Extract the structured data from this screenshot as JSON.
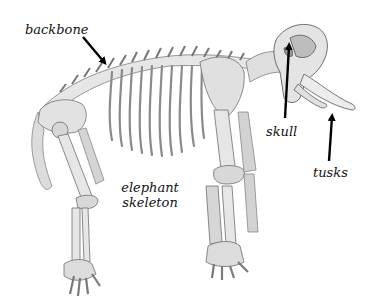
{
  "diagram": {
    "title": "elephant skeleton",
    "title_lines": [
      "elephant",
      "skeleton"
    ],
    "colors": {
      "background": "#ffffff",
      "bone_fill": "#e4e4e4",
      "bone_shade": "#b9b9b9",
      "bone_outline": "#6f6f6f",
      "arrow": "#000000",
      "text": "#111111"
    },
    "labels": [
      {
        "id": "backbone",
        "text": "backbone",
        "x": 25,
        "y": 22,
        "arrow_from": [
          83,
          37
        ],
        "arrow_to": [
          108,
          66
        ]
      },
      {
        "id": "skull",
        "text": "skull",
        "x": 266,
        "y": 125,
        "arrow_from": [
          285,
          118
        ],
        "arrow_to": [
          289,
          42
        ]
      },
      {
        "id": "tusks",
        "text": "tusks",
        "x": 313,
        "y": 166,
        "arrow_from": [
          329,
          161
        ],
        "arrow_to": [
          333,
          113
        ]
      }
    ]
  }
}
